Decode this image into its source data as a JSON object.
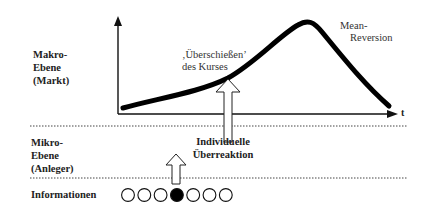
{
  "levels": {
    "macro": [
      "Makro-",
      "Ebene",
      "(Markt)"
    ],
    "micro": [
      "Mikro-",
      "Ebene",
      "(Anleger)"
    ],
    "information": "Informationen"
  },
  "annotations": {
    "overshoot": [
      "‚Überschießen’",
      "des Kurses"
    ],
    "mean_reversion": [
      "Mean-",
      "Reversion"
    ],
    "individual": [
      "Individuelle",
      "Überreaktion"
    ]
  },
  "axis": {
    "x_label": "t"
  },
  "information_circles": {
    "count": 7,
    "filled_index": 3
  }
}
